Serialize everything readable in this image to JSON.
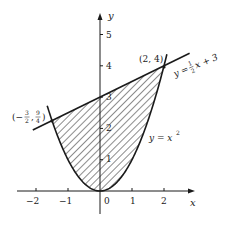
{
  "chart_data": {
    "type": "line",
    "title": "",
    "xlabel": "x",
    "ylabel": "y",
    "xlim": [
      -2.4,
      2.9
    ],
    "ylim": [
      -0.8,
      5.6
    ],
    "grid": false,
    "x_ticks": [
      -2,
      -1,
      0,
      1,
      2
    ],
    "x_tick_labels": [
      "−2",
      "−1",
      "0",
      "1",
      "2"
    ],
    "y_ticks": [
      1,
      2,
      3,
      4,
      5
    ],
    "y_tick_labels": [
      "1",
      "2",
      "3",
      "4",
      "5"
    ],
    "series": [
      {
        "name": "y = x²",
        "expression": "y = x^2",
        "x": [
          -1.65,
          -1.5,
          -1,
          -0.5,
          0,
          0.5,
          1,
          1.5,
          2,
          2.1
        ],
        "values": [
          2.72,
          2.25,
          1,
          0.25,
          0,
          0.25,
          1,
          2.25,
          4,
          4.41
        ]
      },
      {
        "name": "y = ½x + 3",
        "expression": "y = (1/2)x + 3",
        "x": [
          -2.1,
          2.8
        ],
        "values": [
          1.95,
          4.4
        ]
      }
    ],
    "shaded_region": {
      "description": "Region between y = x² (below) and y = ½x + 3 (above), for x from −3/2 to 2",
      "x_from": -1.5,
      "x_to": 2,
      "fill": "diagonal-hatch"
    },
    "annotations": [
      {
        "text": "(2, 4)",
        "x": 2,
        "y": 4
      },
      {
        "text": "(−3/2, 9/4)",
        "x": -1.5,
        "y": 2.25
      },
      {
        "text": "y = ½x + 3",
        "attached_to": "line"
      },
      {
        "text": "y = x²",
        "attached_to": "parabola"
      }
    ],
    "legend_position": "none"
  },
  "labels": {
    "x_axis": "x",
    "y_axis": "y",
    "ticks_x": [
      "−2",
      "−1",
      "0",
      "1",
      "2"
    ],
    "ticks_y": [
      "1",
      "2",
      "3",
      "4",
      "5"
    ],
    "point_right": "(2, 4)",
    "point_left_open": "(−",
    "point_left_num1": "3",
    "point_left_den1": "2",
    "point_left_sep": ",",
    "point_left_num2": "9",
    "point_left_den2": "4",
    "point_left_close": ")",
    "line_label_prefix": "y =",
    "line_label_num": "1",
    "line_label_den": "2",
    "line_label_suffix": "x + 3",
    "parabola_label": "y = x",
    "parabola_exp": "2"
  }
}
